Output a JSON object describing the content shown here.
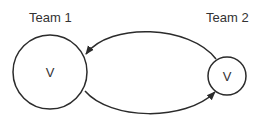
{
  "diagram": {
    "nodes": [
      {
        "id": "team1",
        "title": "Team 1",
        "label": "V",
        "size": "large"
      },
      {
        "id": "team2",
        "title": "Team 2",
        "label": "V",
        "size": "small"
      }
    ],
    "edges": [
      {
        "from": "team2",
        "to": "team1",
        "route": "top"
      },
      {
        "from": "team1",
        "to": "team2",
        "route": "bottom"
      }
    ]
  },
  "colors": {
    "stroke": "#2b2b2b",
    "text": "#333333",
    "background": "#ffffff"
  }
}
